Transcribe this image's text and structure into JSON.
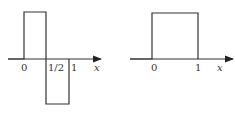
{
  "left_plot": {
    "name": "Haar wavelet",
    "tick_labels": [
      "0",
      "1/2",
      "1"
    ],
    "axis_label": "x",
    "segments": [
      {
        "from": 0,
        "to": 0.5,
        "value": 1
      },
      {
        "from": 0.5,
        "to": 1,
        "value": -1
      }
    ]
  },
  "right_plot": {
    "name": "Box (scaling) function",
    "tick_labels": [
      "0",
      "1"
    ],
    "axis_label": "x",
    "segments": [
      {
        "from": 0,
        "to": 1,
        "value": 1
      }
    ]
  },
  "colors": {
    "line": "#333333",
    "background": "#ffffff"
  }
}
